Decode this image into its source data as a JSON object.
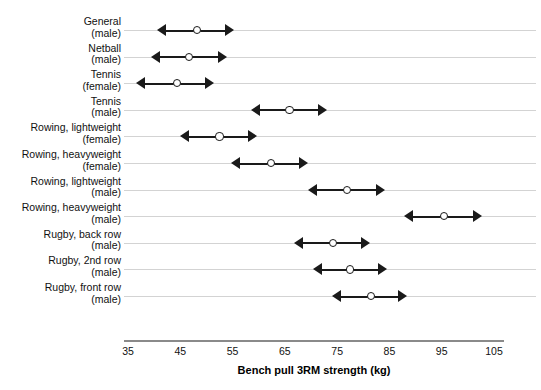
{
  "chart_data": {
    "type": "scatter",
    "title": "",
    "xlabel": "Bench pull 3RM strength (kg)",
    "ylabel": "",
    "xlim": [
      35,
      105
    ],
    "xticks": [
      35,
      45,
      55,
      65,
      75,
      85,
      95,
      105
    ],
    "grid": "horizontal",
    "legend": "none",
    "marker": "open-circle-with-double-headed-arrow-range",
    "categories": [
      {
        "group": "General",
        "sex": "(male)"
      },
      {
        "group": "Netball",
        "sex": "(male)"
      },
      {
        "group": "Tennis",
        "sex": "(female)"
      },
      {
        "group": "Tennis",
        "sex": "(male)"
      },
      {
        "group": "Rowing, lightweight",
        "sex": "(female)"
      },
      {
        "group": "Rowing, heavyweight",
        "sex": "(female)"
      },
      {
        "group": "Rowing, lightweight",
        "sex": "(male)"
      },
      {
        "group": "Rowing, heavyweight",
        "sex": "(male)"
      },
      {
        "group": "Rugby, back row",
        "sex": "(male)"
      },
      {
        "group": "Rugby, 2nd row",
        "sex": "(male)"
      },
      {
        "group": "Rugby, front row",
        "sex": "(male)"
      }
    ],
    "series": [
      {
        "name": "mean",
        "values": [
          48.0,
          46.5,
          44.2,
          65.7,
          52.3,
          62.1,
          76.7,
          95.3,
          74.0,
          77.2,
          81.3
        ]
      },
      {
        "name": "lower",
        "values": [
          40.8,
          39.6,
          36.7,
          58.8,
          45.2,
          54.8,
          69.6,
          88.0,
          66.9,
          70.5,
          74.2
        ]
      },
      {
        "name": "upper",
        "values": [
          55.0,
          53.8,
          51.3,
          72.8,
          59.4,
          69.2,
          83.9,
          102.5,
          81.1,
          84.3,
          88.2
        ]
      }
    ]
  },
  "axis": {
    "title": "Bench pull 3RM strength (kg)",
    "ticks": [
      "35",
      "45",
      "55",
      "65",
      "75",
      "85",
      "95",
      "105"
    ]
  },
  "colors": {
    "marker": "#1a1a1a",
    "gridline": "#d3d3d3",
    "axis": "#8a8a8a",
    "background": "#ffffff",
    "text": "#111111"
  }
}
